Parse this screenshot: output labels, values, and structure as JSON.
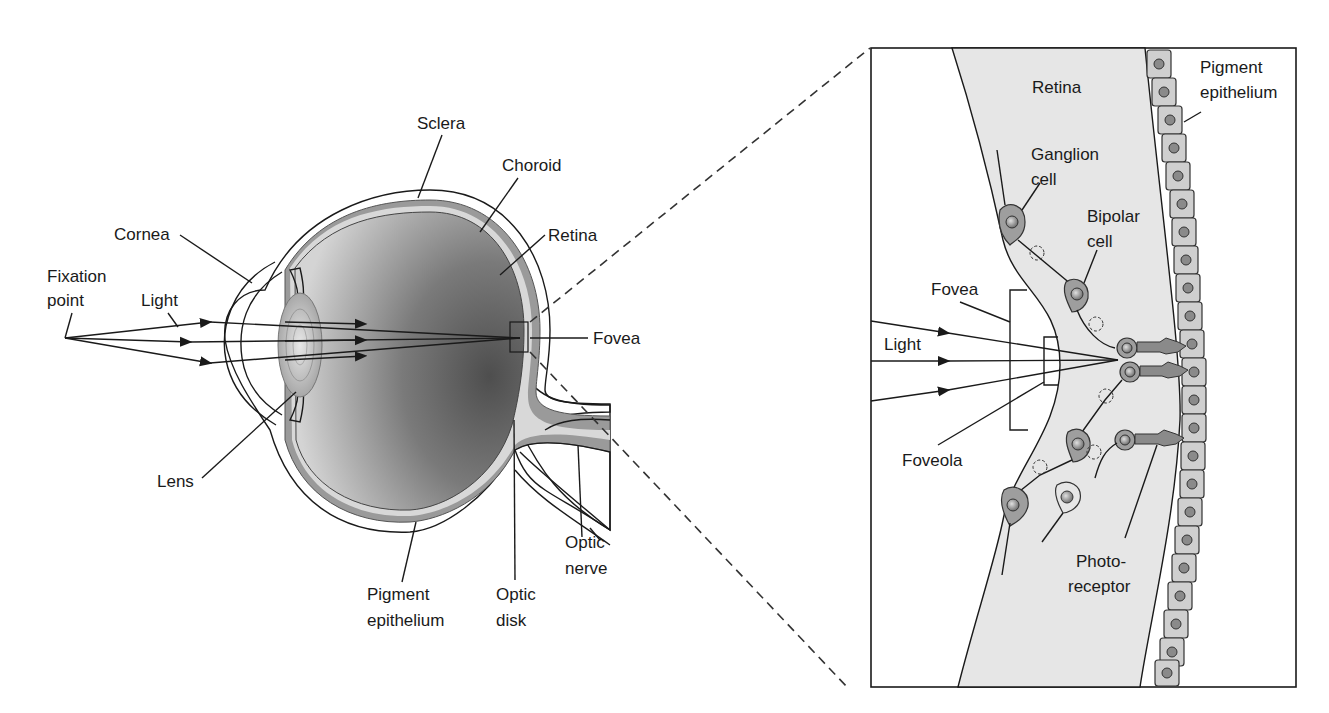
{
  "figure": {
    "type": "anatomical-diagram"
  },
  "left_panel": {
    "labels": {
      "fixation_point_1": "Fixation",
      "fixation_point_2": "point",
      "light": "Light",
      "cornea": "Cornea",
      "sclera": "Sclera",
      "choroid": "Choroid",
      "retina": "Retina",
      "fovea": "Fovea",
      "lens": "Lens",
      "pigment_epithelium_1": "Pigment",
      "pigment_epithelium_2": "epithelium",
      "optic_disk_1": "Optic",
      "optic_disk_2": "disk",
      "optic_nerve_1": "Optic",
      "optic_nerve_2": "nerve"
    },
    "light_rays": 3
  },
  "right_panel": {
    "title_region": "Retina",
    "labels": {
      "retina": "Retina",
      "pigment_epithelium_1": "Pigment",
      "pigment_epithelium_2": "epithelium",
      "ganglion_cell_1": "Ganglion",
      "ganglion_cell_2": "cell",
      "bipolar_cell_1": "Bipolar",
      "bipolar_cell_2": "cell",
      "fovea": "Fovea",
      "light": "Light",
      "foveola": "Foveola",
      "photoreceptor_1": "Photo-",
      "photoreceptor_2": "receptor"
    },
    "light_rays": 3
  },
  "colors": {
    "line": "#1a1a1a",
    "sclera": "#ffffff",
    "choroid": "#9a9a9a",
    "retina_layer": "#d8d8d8",
    "vitreous_dark": "#6e6e6e",
    "vitreous_light": "#c8c8c8",
    "retina_panel_fill": "#e6e6e6",
    "cell_fill": "#9e9e9e"
  }
}
